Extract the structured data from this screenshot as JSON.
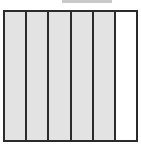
{
  "figure": {
    "name": "segmented-bar-diagram",
    "title": "",
    "background_color": "#ffffff",
    "frame": {
      "border_color": "#2b2b2b",
      "border_width_px": 2,
      "fill_color": "#ffffff",
      "x": 3,
      "y": 10,
      "width": 135,
      "height": 132
    },
    "top_marker": {
      "label": "",
      "color": "#c9c9c9",
      "x": 62,
      "y": 0,
      "width": 50,
      "height": 3
    },
    "segments": [
      {
        "index": 1,
        "state": "filled",
        "fill_color": "#e3e3e3",
        "label": ""
      },
      {
        "index": 2,
        "state": "filled",
        "fill_color": "#e3e3e3",
        "label": ""
      },
      {
        "index": 3,
        "state": "filled",
        "fill_color": "#e3e3e3",
        "label": ""
      },
      {
        "index": 4,
        "state": "filled",
        "fill_color": "#e3e3e3",
        "label": ""
      },
      {
        "index": 5,
        "state": "filled",
        "fill_color": "#e3e3e3",
        "label": ""
      },
      {
        "index": 6,
        "state": "empty",
        "fill_color": "#ffffff",
        "label": ""
      }
    ],
    "counts": {
      "total_segments": 6,
      "filled_segments": 5,
      "empty_segments": 1
    }
  }
}
